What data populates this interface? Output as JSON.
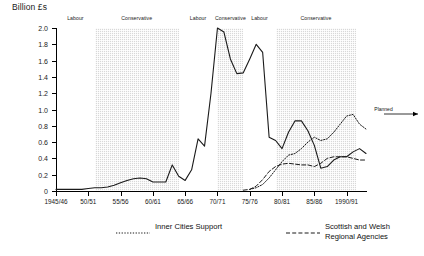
{
  "chart_data": {
    "type": "line",
    "title": "",
    "ylabel": "Billion £s",
    "xlabel": "",
    "ylim": [
      0,
      2.0
    ],
    "xlim": [
      1945,
      1993
    ],
    "grid": false,
    "legend_position": "bottom",
    "y_ticks": [
      "0",
      "0.2",
      "0.4",
      "0.6",
      "0.8",
      "1.0",
      "1.2",
      "1.4",
      "1.6",
      "1.8",
      "2.0"
    ],
    "y_tick_values": [
      0,
      0.2,
      0.4,
      0.6,
      0.8,
      1.0,
      1.2,
      1.4,
      1.6,
      1.8,
      2.0
    ],
    "x_ticks": [
      "1945/46",
      "50/51",
      "55/56",
      "60/61",
      "65/66",
      "70/71",
      "75/76",
      "80/81",
      "85/86",
      "1990/91"
    ],
    "x_tick_values": [
      1945,
      1950,
      1955,
      1960,
      1965,
      1970,
      1975,
      1980,
      1985,
      1990
    ],
    "series": [
      {
        "name": "Inner Cities Support",
        "style": "dotted",
        "x": [
          1975,
          1976,
          1977,
          1978,
          1979,
          1980,
          1981,
          1982,
          1983,
          1984,
          1985,
          1986,
          1987,
          1988,
          1989,
          1990,
          1991,
          1992,
          1993
        ],
        "values": [
          0.02,
          0.04,
          0.08,
          0.16,
          0.26,
          0.36,
          0.44,
          0.46,
          0.52,
          0.6,
          0.66,
          0.62,
          0.64,
          0.72,
          0.82,
          0.92,
          0.94,
          0.82,
          0.76
        ]
      },
      {
        "name": "Scottish and Welsh Regional Agencies",
        "style": "dashed",
        "x": [
          1974,
          1975,
          1976,
          1977,
          1978,
          1979,
          1980,
          1981,
          1982,
          1983,
          1984,
          1985,
          1986,
          1987,
          1988,
          1989,
          1990,
          1991,
          1992,
          1993
        ],
        "values": [
          0.01,
          0.02,
          0.06,
          0.14,
          0.24,
          0.3,
          0.33,
          0.34,
          0.33,
          0.32,
          0.32,
          0.3,
          0.34,
          0.4,
          0.42,
          0.42,
          0.42,
          0.4,
          0.38,
          0.38
        ]
      },
      {
        "name": "Regional Industrial Aid",
        "style": "solid",
        "x": [
          1945,
          1946,
          1947,
          1948,
          1949,
          1950,
          1951,
          1952,
          1953,
          1954,
          1955,
          1956,
          1957,
          1958,
          1959,
          1960,
          1961,
          1962,
          1963,
          1964,
          1965,
          1966,
          1967,
          1968,
          1969,
          1970,
          1971,
          1972,
          1973,
          1974,
          1975,
          1976,
          1977,
          1978,
          1979,
          1980,
          1981,
          1982,
          1983,
          1984,
          1985,
          1986,
          1987,
          1988,
          1989,
          1990,
          1991,
          1992,
          1993
        ],
        "values": [
          0.02,
          0.02,
          0.02,
          0.02,
          0.02,
          0.03,
          0.04,
          0.04,
          0.05,
          0.07,
          0.1,
          0.13,
          0.15,
          0.16,
          0.15,
          0.11,
          0.11,
          0.11,
          0.32,
          0.18,
          0.13,
          0.26,
          0.64,
          0.55,
          1.2,
          2.0,
          1.95,
          1.62,
          1.44,
          1.45,
          1.62,
          1.8,
          1.7,
          0.66,
          0.62,
          0.52,
          0.72,
          0.86,
          0.86,
          0.74,
          0.56,
          0.28,
          0.3,
          0.38,
          0.42,
          0.42,
          0.48,
          0.52,
          0.46
        ]
      }
    ],
    "party_bands": [
      {
        "label": "Labour",
        "start": 1945,
        "end": 1951,
        "shaded": false
      },
      {
        "label": "Conservative",
        "start": 1951,
        "end": 1964,
        "shaded": true
      },
      {
        "label": "Labour",
        "start": 1964,
        "end": 1970,
        "shaded": false
      },
      {
        "label": "Conservative",
        "start": 1970,
        "end": 1974,
        "shaded": true
      },
      {
        "label": "Labour",
        "start": 1974,
        "end": 1979,
        "shaded": false
      },
      {
        "label": "Conservative",
        "start": 1979,
        "end": 1991.5,
        "shaded": true
      }
    ],
    "annotations": [
      {
        "name": "planned",
        "text": "Planned",
        "x": 1991.5,
        "y": 0.95
      }
    ]
  },
  "legend": {
    "entries": [
      {
        "label": "Inner Cities Support",
        "style": "dotted"
      },
      {
        "label": "Scottish and Welsh\nRegional Agencies",
        "style": "dashed"
      },
      {
        "label": "Regional Industrial Aid",
        "style": "solid"
      }
    ]
  }
}
